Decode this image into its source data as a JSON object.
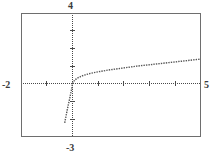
{
  "figure": {
    "kind": "graphing-calculator-plot",
    "background_color": "#ffffff",
    "frame_color": "#6e6e6e",
    "axis_color": "#4a4a4a",
    "curve_color": "#555555"
  },
  "labels": {
    "ymax": "4",
    "ymin": "-3",
    "xmin": "-2",
    "xmax": "5"
  },
  "chart_data": {
    "type": "line",
    "title": "",
    "xlabel": "",
    "ylabel": "",
    "xlim": [
      -2,
      5
    ],
    "ylim": [
      -3,
      4
    ],
    "grid": false,
    "legend": null,
    "axes": {
      "x_axis_at_y": 0,
      "y_axis_at_x": 0,
      "x_tick_spacing": 1,
      "y_tick_spacing": 1,
      "axis_style": "dotted",
      "tick_style": "short-dash"
    },
    "tick_labels": {
      "x": [
        "-2",
        "5"
      ],
      "y": [
        "-3",
        "4"
      ]
    },
    "series": [
      {
        "name": "curve",
        "style": "dotted",
        "x": [
          -0.3,
          -0.28,
          -0.26,
          -0.24,
          -0.22,
          -0.2,
          -0.18,
          -0.16,
          -0.14,
          -0.12,
          -0.1,
          -0.08,
          -0.06,
          -0.04,
          -0.02,
          0.0,
          0.05,
          0.1,
          0.15,
          0.2,
          0.3,
          0.4,
          0.5,
          0.6,
          0.7,
          0.8,
          0.9,
          1.0,
          1.2,
          1.4,
          1.6,
          1.8,
          2.0,
          2.25,
          2.5,
          2.75,
          3.0,
          3.25,
          3.5,
          3.75,
          4.0,
          4.25,
          4.5,
          4.75,
          5.0
        ],
        "y": [
          -2.2,
          -2.05,
          -1.9,
          -1.75,
          -1.6,
          -1.45,
          -1.32,
          -1.18,
          -1.05,
          -0.92,
          -0.78,
          -0.64,
          -0.5,
          -0.36,
          -0.2,
          0.0,
          0.14,
          0.22,
          0.28,
          0.33,
          0.4,
          0.46,
          0.51,
          0.55,
          0.59,
          0.62,
          0.65,
          0.68,
          0.73,
          0.78,
          0.82,
          0.86,
          0.9,
          0.95,
          1.0,
          1.04,
          1.08,
          1.12,
          1.16,
          1.2,
          1.24,
          1.28,
          1.32,
          1.36,
          1.4
        ]
      }
    ]
  }
}
